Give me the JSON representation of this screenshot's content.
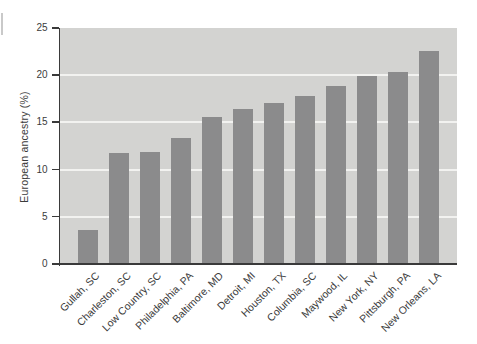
{
  "chart_data": {
    "type": "bar",
    "title": "",
    "xlabel": "",
    "ylabel": "European ancestry (%)",
    "categories": [
      "Gullah, SC",
      "Charleston, SC",
      "Low Country, SC",
      "Philadelphia, PA",
      "Baltimore, MD",
      "Detroit, MI",
      "Houston, TX",
      "Columbia, SC",
      "Maywood, IL",
      "New York, NY",
      "Pittsburgh, PA",
      "New Orleans, LA"
    ],
    "values": [
      3.5,
      11.6,
      11.8,
      13.2,
      15.5,
      16.3,
      16.9,
      17.7,
      18.8,
      19.8,
      20.2,
      22.5
    ],
    "ylim": [
      0,
      25
    ],
    "ytick_step": 5,
    "yticks": [
      "0",
      "5",
      "10",
      "15",
      "20",
      "25"
    ],
    "grid": true,
    "legend": false,
    "colors": {
      "bar": "#8b8b8c",
      "plot_background": "#d3d3d1",
      "gridline": "#f2f2f0",
      "axis": "#3a3a3a",
      "text": "#3b3b3b",
      "page_background": "#ffffff",
      "scan_artifact": "#c9c9c9"
    }
  }
}
